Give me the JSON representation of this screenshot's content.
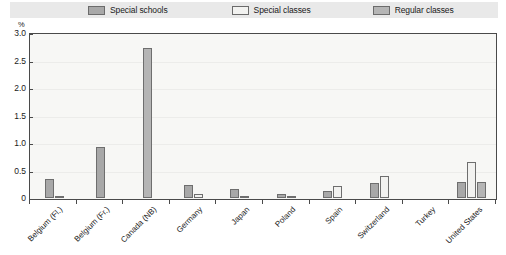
{
  "legend": {
    "items": [
      {
        "label": "Special schools",
        "icon": "legend-swatch-dark",
        "color": "#a8a8a8"
      },
      {
        "label": "Special classes",
        "icon": "legend-swatch-light",
        "color": "#f2f2f0"
      },
      {
        "label": "Regular classes",
        "icon": "legend-swatch-mid",
        "color": "#b5b5b5"
      }
    ]
  },
  "axis": {
    "unit_label": "%",
    "y_ticks": [
      "3.0",
      "2.5",
      "2.0",
      "1.5",
      "1.0",
      "0.5",
      "0"
    ]
  },
  "chart_data": {
    "type": "bar",
    "title": "",
    "subtitle": "",
    "xlabel": "",
    "ylabel": "%",
    "ylim": [
      0,
      3.0
    ],
    "ytick_values": [
      3.0,
      2.5,
      2.0,
      1.5,
      1.0,
      0.5,
      0
    ],
    "grid": true,
    "legend_position": "top",
    "categories": [
      "Belgium (Fl.)",
      "Belgium (Fr.)",
      "Canada (NB)",
      "Germany",
      "Japan",
      "Poland",
      "Spain",
      "Switzerland",
      "Turkey",
      "United States"
    ],
    "series": [
      {
        "name": "Special schools",
        "color": "#a8a8a8",
        "values": [
          0.35,
          0.92,
          0,
          0.23,
          0.17,
          0.08,
          0.13,
          0.28,
          0,
          0.3
        ]
      },
      {
        "name": "Special classes",
        "color": "#f2f2f0",
        "values": [
          0.02,
          0,
          0,
          0.08,
          0.03,
          0.03,
          0.22,
          0.4,
          0,
          0.65
        ]
      },
      {
        "name": "Regular classes",
        "color": "#b5b5b5",
        "values": [
          0,
          0,
          2.72,
          0,
          0,
          0,
          0,
          0,
          0,
          0.3
        ]
      }
    ]
  }
}
